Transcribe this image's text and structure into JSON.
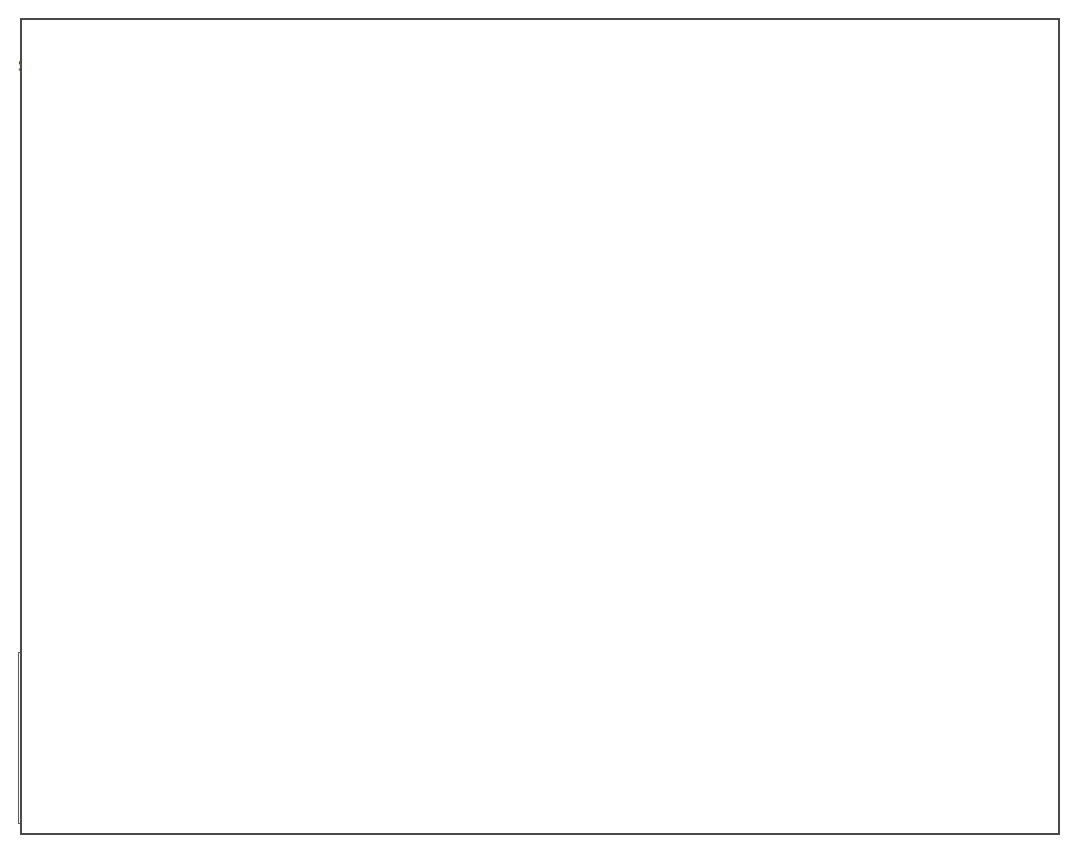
{
  "map": {
    "title_hidden": "Railroads and Time Zones",
    "country_labels": [
      {
        "name": "CANADA",
        "text": "CANADA",
        "x": 513,
        "y": 29
      },
      {
        "name": "MEXICO",
        "text": "MEXICO",
        "x": 283,
        "y": 589
      }
    ],
    "time_zones": [
      {
        "name": "pacific",
        "text": "Pacific Time Zone",
        "x": 92,
        "y": 31
      },
      {
        "name": "mountain",
        "text": "Mountain Time Zone",
        "x": 280,
        "y": 54
      },
      {
        "name": "central",
        "text": "Central Time Zone",
        "x": 533,
        "y": 64
      },
      {
        "name": "eastern",
        "text": "Eastern\nTime Zone",
        "x": 776,
        "y": 90
      }
    ],
    "oceans": [
      {
        "name": "pacific-ocean",
        "text": "PACIFIC\nOCEAN",
        "x": 32,
        "y": 505
      },
      {
        "name": "atlantic-ocean",
        "text": "ATLANTIC\nOCEAN",
        "x": 880,
        "y": 410
      },
      {
        "name": "gulf-of-mexico",
        "text": "Gulf of Mexico",
        "x": 586,
        "y": 607
      }
    ],
    "cities": [
      {
        "name": "Seattle",
        "label": "Seattle",
        "dot_x": 122,
        "dot_y": 82,
        "lx": 63,
        "ly": 68,
        "anchor": "end"
      },
      {
        "name": "Portland",
        "label": "Portland",
        "dot_x": 103,
        "dot_y": 131,
        "lx": 110,
        "ly": 140,
        "anchor": "start"
      },
      {
        "name": "Boise",
        "label": "Boise",
        "dot_x": 196,
        "dot_y": 196,
        "lx": 152,
        "ly": 200,
        "anchor": "end"
      },
      {
        "name": "Helena",
        "label": "Helena",
        "dot_x": 272,
        "dot_y": 143,
        "lx": 282,
        "ly": 138,
        "anchor": "start"
      },
      {
        "name": "Reno",
        "label": "Reno",
        "dot_x": 113,
        "dot_y": 290,
        "lx": 121,
        "ly": 296,
        "anchor": "start"
      },
      {
        "name": "San Francisco",
        "label": "San\nFrancisco",
        "dot_x": 65,
        "dot_y": 287,
        "lx": 48,
        "ly": 322,
        "anchor": "start"
      },
      {
        "name": "Los Angeles",
        "label": "Los\nAngeles",
        "dot_x": 116,
        "dot_y": 413,
        "lx": 55,
        "ly": 408,
        "anchor": "start"
      },
      {
        "name": "Salt Lake City",
        "label": "Salt\nLake\nCity",
        "dot_x": 251,
        "dot_y": 291,
        "lx": 256,
        "ly": 285,
        "anchor": "start"
      },
      {
        "name": "Denver",
        "label": "Denver",
        "dot_x": 374,
        "dot_y": 317,
        "lx": 315,
        "ly": 301,
        "anchor": "start"
      },
      {
        "name": "Phoenix",
        "label": "Phoenix",
        "dot_x": 232,
        "dot_y": 457,
        "lx": 233,
        "ly": 434,
        "anchor": "start"
      },
      {
        "name": "Santa Fe",
        "label": "Santa\nFe",
        "dot_x": 347,
        "dot_y": 422,
        "lx": 352,
        "ly": 413,
        "anchor": "start"
      },
      {
        "name": "El Paso",
        "label": "El Paso",
        "dot_x": 333,
        "dot_y": 511,
        "lx": 339,
        "ly": 505,
        "anchor": "start"
      },
      {
        "name": "St. Paul",
        "label": "St. Paul",
        "dot_x": 564,
        "dot_y": 194,
        "lx": 497,
        "ly": 177,
        "anchor": "start"
      },
      {
        "name": "Omaha",
        "label": "Omaha",
        "dot_x": 519,
        "dot_y": 279,
        "lx": 519,
        "ly": 258,
        "anchor": "start"
      },
      {
        "name": "Kansas City",
        "label": "Kansas\nCity",
        "dot_x": 548,
        "dot_y": 335,
        "lx": 513,
        "ly": 327,
        "anchor": "start"
      },
      {
        "name": "Chicago",
        "label": "Chicago",
        "dot_x": 651,
        "dot_y": 258,
        "lx": 586,
        "ly": 240,
        "anchor": "start"
      },
      {
        "name": "St. Louis",
        "label": "St. Louis",
        "dot_x": 617,
        "dot_y": 341,
        "lx": 613,
        "ly": 325,
        "anchor": "start"
      },
      {
        "name": "Memphis",
        "label": "Memphis",
        "dot_x": 634,
        "dot_y": 420,
        "lx": 564,
        "ly": 396,
        "anchor": "start"
      },
      {
        "name": "Dallas",
        "label": "Dallas",
        "dot_x": 512,
        "dot_y": 493,
        "lx": 458,
        "ly": 478,
        "anchor": "start"
      },
      {
        "name": "Houston",
        "label": "Houston",
        "dot_x": 545,
        "dot_y": 563,
        "lx": 546,
        "ly": 567,
        "anchor": "start"
      },
      {
        "name": "New Orleans",
        "label": "New Orleans",
        "dot_x": 637,
        "dot_y": 548,
        "lx": 628,
        "ly": 554,
        "anchor": "start"
      },
      {
        "name": "Mobile",
        "label": "Mobile",
        "dot_x": 668,
        "dot_y": 525,
        "lx": 678,
        "ly": 527,
        "anchor": "start"
      },
      {
        "name": "Atlanta",
        "label": "Atlanta",
        "dot_x": 742,
        "dot_y": 431,
        "lx": 744,
        "ly": 414,
        "anchor": "start"
      },
      {
        "name": "Charleston",
        "label": "Charleston",
        "dot_x": 818,
        "dot_y": 450,
        "lx": 822,
        "ly": 456,
        "anchor": "start"
      },
      {
        "name": "Norfolk",
        "label": "Norfolk",
        "dot_x": 872,
        "dot_y": 345,
        "lx": 874,
        "ly": 346,
        "anchor": "start"
      },
      {
        "name": "Washington, D.C.",
        "label": "Washington, D.C.",
        "dot_x": 845,
        "dot_y": 290,
        "lx": 846,
        "ly": 293,
        "anchor": "start"
      },
      {
        "name": "Philadelphia",
        "label": "Philadelphia",
        "dot_x": 863,
        "dot_y": 270,
        "lx": 868,
        "ly": 272,
        "anchor": "start"
      },
      {
        "name": "New York",
        "label": "New York",
        "dot_x": 871,
        "dot_y": 243,
        "lx": 886,
        "ly": 240,
        "anchor": "start"
      },
      {
        "name": "Boston",
        "label": "Boston",
        "dot_x": 920,
        "dot_y": 185,
        "lx": 928,
        "ly": 176,
        "anchor": "start"
      },
      {
        "name": "Buffalo",
        "label": "Buffalo",
        "dot_x": 793,
        "dot_y": 207,
        "lx": 803,
        "ly": 199,
        "anchor": "start"
      },
      {
        "name": "Cleveland",
        "label": "Cleveland",
        "dot_x": 752,
        "dot_y": 259,
        "lx": 757,
        "ly": 246,
        "anchor": "start"
      },
      {
        "name": "Detroit",
        "label": "Detroit",
        "dot_x": 727,
        "dot_y": 236,
        "lx": 673,
        "ly": 219,
        "anchor": "start"
      },
      {
        "name": "Pittsburgh",
        "label": "Pittsburgh",
        "dot_x": 789,
        "dot_y": 271,
        "lx": 722,
        "ly": 277,
        "anchor": "start"
      }
    ]
  },
  "legend": {
    "items": [
      {
        "name": "railroads-1870",
        "label": "Major railroads in 1870",
        "weight": 2
      },
      {
        "name": "railroads-added",
        "label": "Major railroads added\n1870–1890",
        "weight": 3.4
      },
      {
        "name": "transcontinental",
        "label": "Transcontinental railroad",
        "weight": 5.4
      }
    ]
  },
  "inset": {
    "lakes": [
      {
        "name": "lake-michigan",
        "text": "L. Michigan",
        "x": 57,
        "y": 748,
        "rotate": -74
      },
      {
        "name": "lake-huron",
        "text": "L.\nHuron",
        "x": 205,
        "y": 671,
        "rotate": 0
      },
      {
        "name": "lake-ontario",
        "text": "L. Ontario",
        "x": 315,
        "y": 676,
        "rotate": -13
      },
      {
        "name": "lake-erie",
        "text": "L. Erie",
        "x": 232,
        "y": 748,
        "rotate": -12
      }
    ],
    "cities": [
      {
        "name": "Chicago",
        "label": "Chicago",
        "dot_x": 30,
        "dot_y": 786,
        "lx": 36,
        "ly": 769
      },
      {
        "name": "Cleveland",
        "label": "Cleveland",
        "dot_x": 243,
        "dot_y": 804,
        "lx": 233,
        "ly": 808
      },
      {
        "name": "Buffalo",
        "label": "Buffalo",
        "dot_x": 343,
        "dot_y": 716,
        "lx": 280,
        "ly": 702
      },
      {
        "name": "Albany",
        "label": "Albany",
        "dot_x": 508,
        "dot_y": 703,
        "lx": 449,
        "ly": 702
      },
      {
        "name": "New York",
        "label": "New York",
        "dot_x": 519,
        "dot_y": 796,
        "lx": 446,
        "ly": 791
      }
    ],
    "railroad_label": {
      "name": "new-york-central-rr",
      "part1": "NEW YORK",
      "part2": "CENTRAL  R.R."
    }
  },
  "colors": {
    "land": "#c9c9c9",
    "land_mountain": "#bdbdbd",
    "land_pacific": "#d6d6d6",
    "water": "#ffffff",
    "rail": "#2a2a2a",
    "rail_new": "#1f1f1f",
    "transcontinental": "#111111",
    "border": "#4a4a4a",
    "state_line": "#8d8d8d"
  }
}
